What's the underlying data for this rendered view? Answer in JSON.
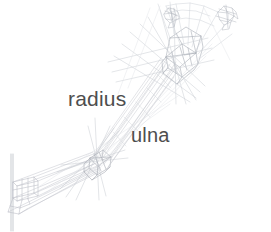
{
  "image": {
    "title": "Forearm bone wireframe illustration",
    "background_color": "#ffffff",
    "width": 271,
    "height": 232,
    "subject": "wireframe rendering of human forearm skeleton seen in perspective, elbow at lower left and hand at upper right"
  },
  "labels": [
    {
      "id": "radius",
      "text": "radius",
      "color": "#4e4e4e",
      "x": 68,
      "y": 88,
      "font_size": 21
    },
    {
      "id": "ulna",
      "text": "ulna",
      "color": "#4e4e4e",
      "x": 131,
      "y": 125,
      "font_size": 20
    }
  ],
  "wireframe": {
    "stroke_color": "#b9bcc4",
    "stroke_color_faint": "#d7d9de",
    "stroke_color_strong": "#9a9ea8",
    "stroke_width": 0.5,
    "parts": [
      {
        "id": "humerus-axis",
        "name": "vertical reference axis",
        "description": "long vertical line at far left"
      },
      {
        "id": "elbow-block",
        "name": "elbow joint block",
        "description": "small box cage at lower left"
      },
      {
        "id": "shaft-lower",
        "name": "lower forearm shaft",
        "description": "tapered ribbon from elbow block to mid joint"
      },
      {
        "id": "mid-joint",
        "name": "mid forearm joint",
        "description": "crossing star of construction lines at center-left"
      },
      {
        "id": "radius-shaft",
        "name": "radius shaft",
        "description": "upper-left of the two parallel diagonal shafts"
      },
      {
        "id": "ulna-shaft",
        "name": "ulna shaft",
        "description": "lower-right of the two parallel diagonal shafts"
      },
      {
        "id": "wrist-joint",
        "name": "wrist joint cage",
        "description": "dense cluster of boxes and radiating lines at upper right"
      },
      {
        "id": "hand-fan",
        "name": "metacarpal fan",
        "description": "fan of thin lines spreading up-right from the wrist"
      },
      {
        "id": "finger-cluster-left",
        "name": "left finger bone cluster",
        "description": "small scribbled bone cluster at top"
      },
      {
        "id": "finger-cluster-right",
        "name": "right finger bone cluster",
        "description": "small scribbled bone cluster at top right"
      }
    ]
  }
}
